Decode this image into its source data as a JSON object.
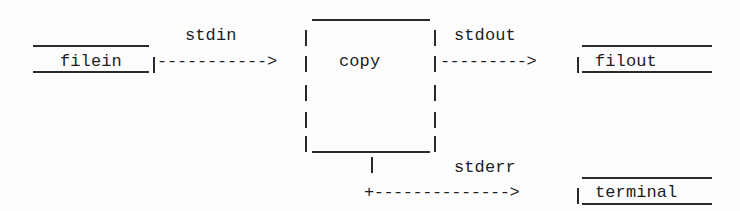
{
  "diagram": {
    "process": {
      "label": "copy"
    },
    "streams": {
      "stdin": "stdin",
      "stdout": "stdout",
      "stderr": "stderr"
    },
    "files": {
      "input": "filein",
      "output": "filout",
      "terminal": "terminal"
    },
    "arrows": {
      "stdin_arrow": "----------->",
      "stdout_arrow": "--------->",
      "stderr_arrow": "+-------------->"
    },
    "colors": {
      "ink": "#1e1e1e",
      "background": "#fdfdfd"
    }
  }
}
